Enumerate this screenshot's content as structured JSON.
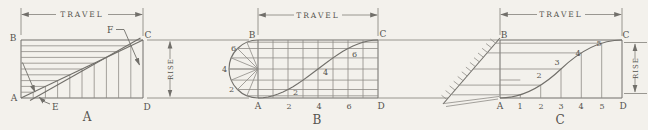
{
  "colors": {
    "background": "#f3f1ec",
    "line": "#8e8c87",
    "dark_line": "#716f6a",
    "text": "#55534e"
  },
  "diagrams": {
    "a": {
      "caption": "A",
      "travel_label": "TRAVEL",
      "rise_label": "RISE",
      "corner_b": "B",
      "corner_c": "C",
      "corner_a": "A",
      "corner_d": "D",
      "point_e": "E",
      "point_f": "F"
    },
    "b": {
      "caption": "B",
      "travel_label": "TRAVEL",
      "corner_b": "B",
      "corner_c": "C",
      "corner_a": "A",
      "corner_d": "D",
      "left_ticks": [
        "6",
        "4",
        "2"
      ],
      "bottom_ticks": [
        "2",
        "4",
        "6"
      ],
      "curve_ticks": [
        "2",
        "4",
        "6"
      ]
    },
    "c": {
      "caption": "C",
      "travel_label": "TRAVEL",
      "rise_label": "RISE",
      "corner_b": "B",
      "corner_c": "C",
      "corner_a": "A",
      "corner_d": "D",
      "bottom_ticks": [
        "1",
        "2",
        "3",
        "4",
        "5"
      ],
      "curve_ticks": [
        "2",
        "3",
        "4",
        "5"
      ]
    }
  }
}
